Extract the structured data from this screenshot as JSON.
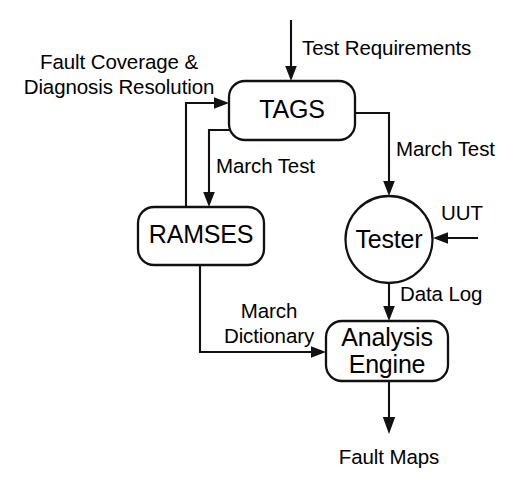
{
  "diagram": {
    "background_color": "#ffffff",
    "line_color": "#111111",
    "text_color": "#000000",
    "nodes": [
      {
        "id": "tags",
        "label": "TAGS",
        "shape": "rounded-rect"
      },
      {
        "id": "ramses",
        "label": "RAMSES",
        "shape": "rounded-rect"
      },
      {
        "id": "tester",
        "label": "Tester",
        "shape": "circle"
      },
      {
        "id": "analysis",
        "label_line1": "Analysis",
        "label_line2": "Engine",
        "shape": "rounded-rect"
      }
    ],
    "edge_labels": {
      "test_requirements": "Test Requirements",
      "march_test_to_tester": "March Test",
      "march_test_to_ramses": "March Test",
      "feedback_line1": "Fault Coverage &",
      "feedback_line2": "Diagnosis Resolution",
      "uut": "UUT",
      "data_log": "Data Log",
      "march_dictionary_line1": "March",
      "march_dictionary_line2": "Dictionary",
      "fault_maps": "Fault Maps"
    }
  }
}
